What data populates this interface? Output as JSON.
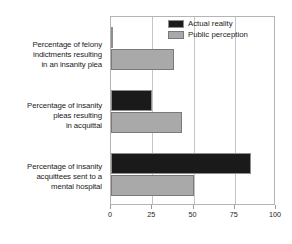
{
  "chart_data": {
    "type": "bar",
    "orientation": "horizontal",
    "title": "",
    "subtitle": "",
    "xlabel": "",
    "ylabel": "",
    "xlim": [
      0,
      100
    ],
    "xticks": [
      0,
      25,
      50,
      75,
      100
    ],
    "xtick_labels": [
      "0",
      "25",
      "50",
      "75",
      "100"
    ],
    "grid": true,
    "grid_axis": "x",
    "legend_position": "top-right",
    "categories": [
      "Percentage of felony indictments resulting in an insanity plea",
      "Percentage of insanity pleas resulting in acquittal",
      "Percentage of insanity acquittees sent to a mental hospital"
    ],
    "category_lines": [
      [
        "Percentage of felony",
        "indictments resulting",
        "in an insanity plea"
      ],
      [
        "Percentage of insanity",
        "pleas resulting",
        "in acquittal"
      ],
      [
        "Percentage of insanity",
        "acquittees sent to a",
        "mental hospital"
      ]
    ],
    "series": [
      {
        "name": "Actual reality",
        "color": "#1a1a1a",
        "values": [
          1,
          25,
          85
        ]
      },
      {
        "name": "Public perception",
        "color": "#a9a9a9",
        "values": [
          38,
          43,
          50
        ]
      }
    ]
  },
  "legend": {
    "items": [
      {
        "label": "Actual reality",
        "swatch": "actual"
      },
      {
        "label": "Public perception",
        "swatch": "perception"
      }
    ]
  },
  "colors": {
    "actual": "#1a1a1a",
    "perception": "#a9a9a9",
    "grid": "#c4c4c4",
    "frame": "#b4b4b4",
    "text": "#1b1b1b",
    "background": "#ffffff"
  }
}
